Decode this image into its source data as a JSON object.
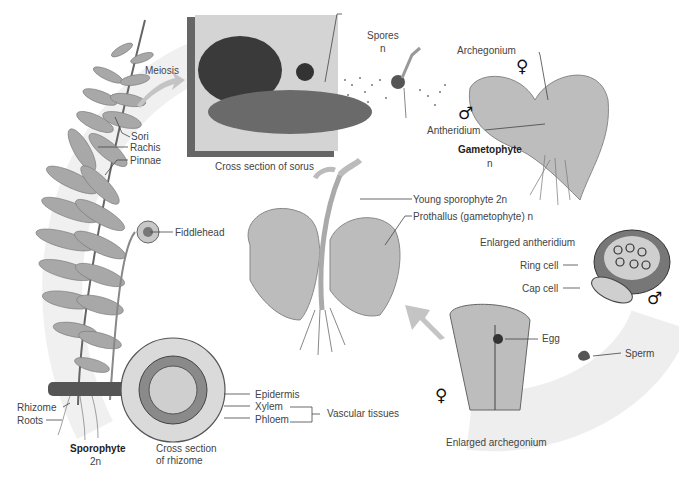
{
  "diagram": {
    "labels": {
      "meiosis": "Meiosis",
      "sori": "Sori",
      "rachis": "Rachis",
      "pinnae": "Pinnae",
      "fiddlehead": "Fiddlehead",
      "cross_section_sorus": "Cross section of sorus",
      "spores": "Spores",
      "spores_ploidy": "n",
      "archegonium": "Archegonium",
      "antheridium": "Antheridium",
      "gametophyte": "Gametophyte",
      "gametophyte_ploidy": "n",
      "young_sporophyte": "Young sporophyte  2n",
      "prothallus": "Prothallus (gametophyte)  n",
      "enlarged_antheridium": "Enlarged antheridium",
      "ring_cell": "Ring cell",
      "cap_cell": "Cap cell",
      "egg": "Egg",
      "sperm": "Sperm",
      "enlarged_archegonium": "Enlarged archegonium",
      "epidermis": "Epidermis",
      "xylem": "Xylem",
      "phloem": "Phloem",
      "vascular_tissues": "Vascular tissues",
      "rhizome": "Rhizome",
      "roots": "Roots",
      "sporophyte": "Sporophyte",
      "sporophyte_ploidy": "2n",
      "cross_section_rhizome_1": "Cross section",
      "cross_section_rhizome_2": "of rhizome"
    },
    "symbols": {
      "female": "♀",
      "male": "♂"
    },
    "colors": {
      "ink": "#333333",
      "background_arc": "#ececec",
      "leaf": "#9a9a9a",
      "dark": "#555555"
    }
  }
}
